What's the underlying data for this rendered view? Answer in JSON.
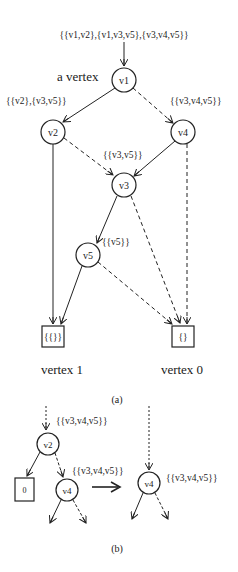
{
  "figure": {
    "part_a": {
      "input_label": "{{v1,v2},{v1,v3,v5},{v3,v4,v5}}",
      "vertex_annotation": "a vertex",
      "nodes": {
        "v1": "v1",
        "v2": "v2",
        "v3": "v3",
        "v4": "v4",
        "v5": "v5"
      },
      "edge_labels": {
        "v1_to_v2": "{{v2},{v3,v5}}",
        "v1_to_v4": "{{v3,v4,v5}}",
        "to_v3": "{{v3,v5}}",
        "v3_to_v5": "{{v5}}"
      },
      "terminals": {
        "one_box": "{{}}",
        "zero_box": "{}",
        "one_caption": "vertex 1",
        "zero_caption": "vertex 0"
      },
      "caption": "(a)"
    },
    "part_b": {
      "top_label": "{{v3,v4,v5}}",
      "left_v2": "v2",
      "left_v4": "v4",
      "zero_box": "0",
      "left_v4_label": "{{v3,v4,v5}}",
      "right_v4": "v4",
      "right_v4_label": "{{v3,v4,v5}}",
      "caption": "(b)"
    }
  }
}
